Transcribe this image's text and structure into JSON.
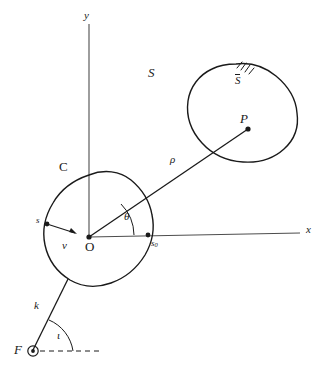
{
  "figure": {
    "kind": "line-diagram",
    "background_color": "#ffffff",
    "stroke_color": "#1a1a1a",
    "axis_color": "#555555"
  },
  "axes": {
    "x_label": "x",
    "y_label": "y",
    "origin_label": "O"
  },
  "curves": {
    "inner_label": "C",
    "outer_region_label": "S",
    "surface_label": "S",
    "surface_label_has_overbar": true
  },
  "points": {
    "origin": "O",
    "field_point": "P",
    "source": "F",
    "boundary_point": "s",
    "axis_point": "s",
    "axis_point_sub": "0"
  },
  "vectors": {
    "rho": "ρ",
    "nu": "ν",
    "k": "k"
  },
  "angles": {
    "theta": "θ",
    "iota": "ι"
  }
}
